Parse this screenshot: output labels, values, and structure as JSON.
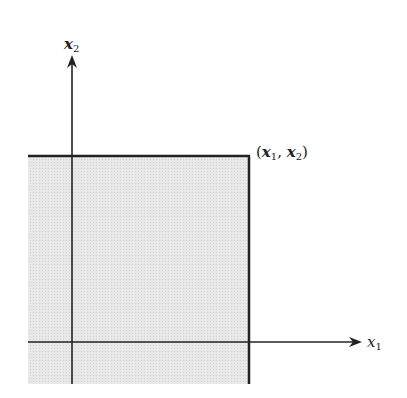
{
  "diagram": {
    "labels": {
      "y_axis_var": "x",
      "y_axis_sub": "2",
      "x_axis_var": "x",
      "x_axis_sub": "1",
      "point_open": "(",
      "point_var1": "x",
      "point_sub1": "1",
      "point_comma": ", ",
      "point_var2": "x",
      "point_sub2": "2",
      "point_close": ")"
    },
    "colors": {
      "region_fill": "#e6e6e6",
      "line": "#222222"
    }
  }
}
